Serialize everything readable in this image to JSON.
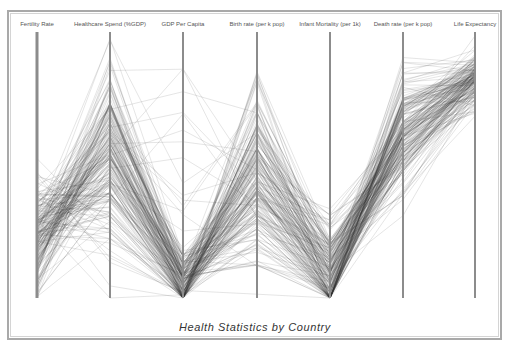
{
  "chart_data": {
    "type": "parallel_coordinates",
    "title": "Health Statistics by Country",
    "axes": [
      {
        "name": "Fertility Rate",
        "x": 37
      },
      {
        "name": "Healthcare Spend (%GDP)",
        "x": 110
      },
      {
        "name": "GDP Per Capita",
        "x": 183
      },
      {
        "name": "Birth rate (per k pop)",
        "x": 257
      },
      {
        "name": "Infant Mortality (per 1k)",
        "x": 330
      },
      {
        "name": "Death rate (per k pop)",
        "x": 403
      },
      {
        "name": "Life Expectancy",
        "x": 475
      }
    ],
    "axis_range_px": {
      "top": 32,
      "bottom": 298
    },
    "series_count_approx": 200,
    "distribution_notes": "Normalized 0 (bottom) to 1 (top). Fertility clusters low-mid; Healthcare spend mid-high; GDP per capita mostly near bottom; Birth rate mid; Infant mortality low; Death rate mid-high; Life expectancy high.",
    "axis_means": [
      0.22,
      0.55,
      0.05,
      0.45,
      0.08,
      0.62,
      0.82
    ],
    "axis_spreads": [
      0.14,
      0.22,
      0.08,
      0.22,
      0.14,
      0.16,
      0.07
    ],
    "line_color": "#333333",
    "line_opacity": 0.16,
    "axis_color": "#8c8c8c"
  },
  "title": "Health Statistics by Country"
}
